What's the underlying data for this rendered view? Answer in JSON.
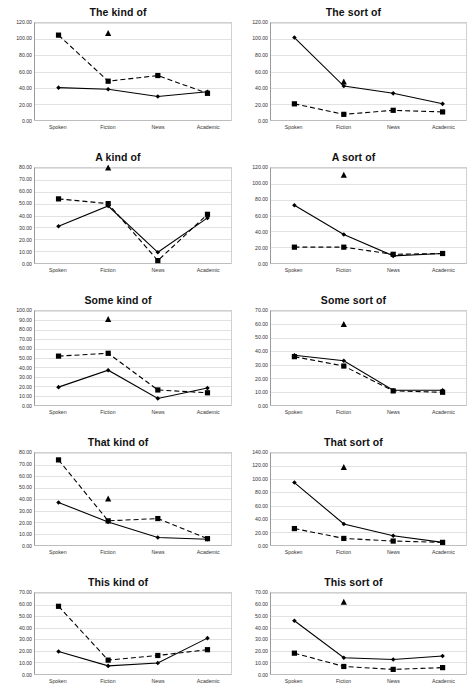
{
  "figure": {
    "categories": [
      "Spoken",
      "Fiction",
      "News",
      "Academic"
    ],
    "marker_solid": "diamond-square",
    "marker_dashed": "square",
    "marker_point": "triangle"
  },
  "chart_data": [
    {
      "type": "line",
      "title": "The kind of",
      "xlabel": "",
      "ylabel": "",
      "categories": [
        "Spoken",
        "Fiction",
        "News",
        "Academic"
      ],
      "ylim": [
        0,
        120
      ],
      "ytick_step": 20,
      "yticks": [
        "0.00",
        "20.00",
        "40.00",
        "60.00",
        "80.00",
        "100.00",
        "120.00"
      ],
      "grid": true,
      "legend": "none",
      "series": [
        {
          "name": "solid",
          "style": "solid",
          "marker": "diamond",
          "values": [
            40,
            38,
            29,
            35
          ]
        },
        {
          "name": "dashed",
          "style": "dashed",
          "marker": "square",
          "values": [
            105,
            48,
            55,
            33
          ]
        },
        {
          "name": "point",
          "style": "none",
          "marker": "triangle",
          "values": [
            null,
            107,
            null,
            null
          ]
        }
      ]
    },
    {
      "type": "line",
      "title": "The sort of",
      "xlabel": "",
      "ylabel": "",
      "categories": [
        "Spoken",
        "Fiction",
        "News",
        "Academic"
      ],
      "ylim": [
        0,
        120
      ],
      "ytick_step": 20,
      "yticks": [
        "0.00",
        "20.00",
        "40.00",
        "60.00",
        "80.00",
        "100.00",
        "120.00"
      ],
      "grid": true,
      "legend": "none",
      "series": [
        {
          "name": "solid",
          "style": "solid",
          "marker": "diamond",
          "values": [
            102,
            42,
            33,
            20
          ]
        },
        {
          "name": "dashed",
          "style": "dashed",
          "marker": "square",
          "values": [
            20,
            7,
            12,
            10
          ]
        },
        {
          "name": "point",
          "style": "none",
          "marker": "triangle",
          "values": [
            null,
            47,
            null,
            null
          ]
        }
      ]
    },
    {
      "type": "line",
      "title": "A kind of",
      "xlabel": "",
      "ylabel": "",
      "categories": [
        "Spoken",
        "Fiction",
        "News",
        "Academic"
      ],
      "ylim": [
        0,
        80
      ],
      "ytick_step": 10,
      "yticks": [
        "0.00",
        "10.00",
        "20.00",
        "30.00",
        "40.00",
        "50.00",
        "60.00",
        "70.00",
        "80.00"
      ],
      "grid": true,
      "legend": "none",
      "series": [
        {
          "name": "solid",
          "style": "solid",
          "marker": "diamond",
          "values": [
            31,
            48,
            9,
            38
          ]
        },
        {
          "name": "dashed",
          "style": "dashed",
          "marker": "square",
          "values": [
            54,
            50,
            2,
            41
          ]
        },
        {
          "name": "point",
          "style": "none",
          "marker": "triangle",
          "values": [
            null,
            80,
            null,
            null
          ]
        }
      ]
    },
    {
      "type": "line",
      "title": "A sort of",
      "xlabel": "",
      "ylabel": "",
      "categories": [
        "Spoken",
        "Fiction",
        "News",
        "Academic"
      ],
      "ylim": [
        0,
        120
      ],
      "ytick_step": 20,
      "yticks": [
        "0.00",
        "20.00",
        "40.00",
        "60.00",
        "80.00",
        "100.00",
        "120.00"
      ],
      "grid": true,
      "legend": "none",
      "series": [
        {
          "name": "solid",
          "style": "solid",
          "marker": "diamond",
          "values": [
            73,
            36,
            9,
            12
          ]
        },
        {
          "name": "dashed",
          "style": "dashed",
          "marker": "square",
          "values": [
            20,
            20,
            11,
            12
          ]
        },
        {
          "name": "point",
          "style": "none",
          "marker": "triangle",
          "values": [
            null,
            111,
            null,
            null
          ]
        }
      ]
    },
    {
      "type": "line",
      "title": "Some kind of",
      "xlabel": "",
      "ylabel": "",
      "categories": [
        "Spoken",
        "Fiction",
        "News",
        "Academic"
      ],
      "ylim": [
        0,
        100
      ],
      "ytick_step": 10,
      "yticks": [
        "0.00",
        "10.00",
        "20.00",
        "30.00",
        "40.00",
        "50.00",
        "60.00",
        "70.00",
        "80.00",
        "90.00",
        "100.00"
      ],
      "grid": true,
      "legend": "none",
      "series": [
        {
          "name": "solid",
          "style": "solid",
          "marker": "diamond",
          "values": [
            19,
            37,
            7,
            18
          ]
        },
        {
          "name": "dashed",
          "style": "dashed",
          "marker": "square",
          "values": [
            52,
            55,
            16,
            13
          ]
        },
        {
          "name": "point",
          "style": "none",
          "marker": "triangle",
          "values": [
            null,
            91,
            null,
            null
          ]
        }
      ]
    },
    {
      "type": "line",
      "title": "Some sort of",
      "xlabel": "",
      "ylabel": "",
      "categories": [
        "Spoken",
        "Fiction",
        "News",
        "Academic"
      ],
      "ylim": [
        0,
        70
      ],
      "ytick_step": 10,
      "yticks": [
        "0.00",
        "10.00",
        "20.00",
        "30.00",
        "40.00",
        "50.00",
        "60.00",
        "70.00"
      ],
      "grid": true,
      "legend": "none",
      "series": [
        {
          "name": "solid",
          "style": "solid",
          "marker": "diamond",
          "values": [
            37,
            33,
            11,
            11
          ]
        },
        {
          "name": "dashed",
          "style": "dashed",
          "marker": "square",
          "values": [
            36,
            29,
            10.5,
            9.5
          ]
        },
        {
          "name": "point",
          "style": "none",
          "marker": "triangle",
          "values": [
            null,
            60,
            null,
            null
          ]
        }
      ]
    },
    {
      "type": "line",
      "title": "That kind of",
      "xlabel": "",
      "ylabel": "",
      "categories": [
        "Spoken",
        "Fiction",
        "News",
        "Academic"
      ],
      "ylim": [
        0,
        80
      ],
      "ytick_step": 10,
      "yticks": [
        "0.00",
        "10.00",
        "20.00",
        "30.00",
        "40.00",
        "50.00",
        "60.00",
        "70.00",
        "80.00"
      ],
      "grid": true,
      "legend": "none",
      "series": [
        {
          "name": "solid",
          "style": "solid",
          "marker": "diamond",
          "values": [
            37,
            20,
            6.5,
            5
          ]
        },
        {
          "name": "dashed",
          "style": "dashed",
          "marker": "square",
          "values": [
            74,
            21,
            23,
            5.5
          ]
        },
        {
          "name": "point",
          "style": "none",
          "marker": "triangle",
          "values": [
            null,
            40,
            null,
            null
          ]
        }
      ]
    },
    {
      "type": "line",
      "title": "That sort of",
      "xlabel": "",
      "ylabel": "",
      "categories": [
        "Spoken",
        "Fiction",
        "News",
        "Academic"
      ],
      "ylim": [
        0,
        140
      ],
      "ytick_step": 20,
      "yticks": [
        "0.00",
        "20.00",
        "40.00",
        "60.00",
        "80.00",
        "100.00",
        "120.00",
        "140.00"
      ],
      "grid": true,
      "legend": "none",
      "series": [
        {
          "name": "solid",
          "style": "solid",
          "marker": "diamond",
          "values": [
            95,
            32,
            14,
            4
          ]
        },
        {
          "name": "dashed",
          "style": "dashed",
          "marker": "square",
          "values": [
            25,
            10,
            6,
            4
          ]
        },
        {
          "name": "point",
          "style": "none",
          "marker": "triangle",
          "values": [
            null,
            118,
            null,
            null
          ]
        }
      ]
    },
    {
      "type": "line",
      "title": "This kind of",
      "xlabel": "",
      "ylabel": "",
      "categories": [
        "Spoken",
        "Fiction",
        "News",
        "Academic"
      ],
      "ylim": [
        0,
        70
      ],
      "ytick_step": 10,
      "yticks": [
        "0.00",
        "10.00",
        "20.00",
        "30.00",
        "40.00",
        "50.00",
        "60.00",
        "70.00"
      ],
      "grid": true,
      "legend": "none",
      "series": [
        {
          "name": "solid",
          "style": "solid",
          "marker": "diamond",
          "values": [
            19.5,
            7,
            9.5,
            31
          ]
        },
        {
          "name": "dashed",
          "style": "dashed",
          "marker": "square",
          "values": [
            58.5,
            12,
            16,
            21
          ]
        },
        {
          "name": "point",
          "style": "none",
          "marker": "triangle",
          "values": [
            null,
            null,
            null,
            null
          ]
        }
      ]
    },
    {
      "type": "line",
      "title": "This sort of",
      "xlabel": "",
      "ylabel": "",
      "categories": [
        "Spoken",
        "Fiction",
        "News",
        "Academic"
      ],
      "ylim": [
        0,
        70
      ],
      "ytick_step": 10,
      "yticks": [
        "0.00",
        "10.00",
        "20.00",
        "30.00",
        "40.00",
        "50.00",
        "60.00",
        "70.00"
      ],
      "grid": true,
      "legend": "none",
      "series": [
        {
          "name": "solid",
          "style": "solid",
          "marker": "diamond",
          "values": [
            46,
            14,
            12.5,
            15.5
          ]
        },
        {
          "name": "dashed",
          "style": "dashed",
          "marker": "square",
          "values": [
            18,
            6.5,
            4,
            5.5
          ]
        },
        {
          "name": "point",
          "style": "none",
          "marker": "triangle",
          "values": [
            null,
            62,
            null,
            null
          ]
        }
      ]
    }
  ]
}
